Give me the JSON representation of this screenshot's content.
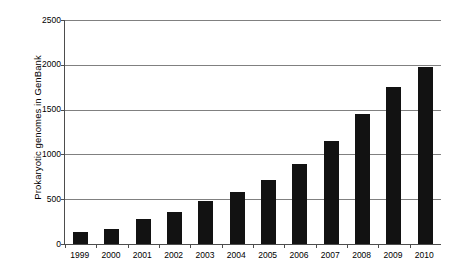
{
  "chart_data": {
    "type": "bar",
    "title": "",
    "xlabel": "",
    "ylabel": "Prokaryotic genomes in GenBank",
    "categories": [
      "1999",
      "2000",
      "2001",
      "2002",
      "2003",
      "2004",
      "2005",
      "2006",
      "2007",
      "2008",
      "2009",
      "2010"
    ],
    "values": [
      135,
      165,
      280,
      360,
      480,
      580,
      720,
      890,
      1150,
      1450,
      1750,
      1980
    ],
    "ylim": [
      0,
      2500
    ],
    "yticks": [
      0,
      500,
      1000,
      1500,
      2000,
      2500
    ],
    "ytick_labels": [
      "0",
      "500",
      "1000",
      "1500",
      "2000",
      "2500"
    ],
    "grid": true,
    "legend": false,
    "bar_color": "#121212",
    "gridline_color": "#808080",
    "axis_color": "#4d4d4d",
    "background": "#ffffff"
  }
}
